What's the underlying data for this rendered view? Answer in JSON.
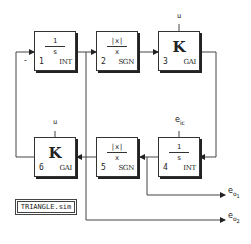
{
  "diagram": {
    "title": "TRIANGLE.sim",
    "line_color": "#333333",
    "blocks": [
      {
        "id": 1,
        "number": "1",
        "type": "INT",
        "numerator": "1",
        "denominator": "s",
        "kind": "fraction"
      },
      {
        "id": 2,
        "number": "2",
        "type": "SGN",
        "numerator": "|x|",
        "denominator": "x",
        "kind": "fraction"
      },
      {
        "id": 3,
        "number": "3",
        "type": "GAI",
        "symbol": "K",
        "kind": "gain",
        "param_label": "u"
      },
      {
        "id": 4,
        "number": "4",
        "type": "INT",
        "numerator": "1",
        "denominator": "s",
        "kind": "fraction",
        "param_label": "e"
      },
      {
        "id": 5,
        "number": "5",
        "type": "SGN",
        "numerator": "|x|",
        "denominator": "x",
        "kind": "fraction"
      },
      {
        "id": 6,
        "number": "6",
        "type": "GAI",
        "symbol": "K",
        "kind": "gain",
        "param_label": "u"
      }
    ],
    "labels": {
      "minus_sign": "-",
      "eic_base": "e",
      "eic_sub": "ic",
      "eo1_base": "e",
      "eo1_sub": "o",
      "eo1_subsub": "1",
      "eo2_base": "e",
      "eo2_sub": "o",
      "eo2_subsub": "2"
    },
    "connections": [
      {
        "from": "1",
        "to": "2"
      },
      {
        "from": "2",
        "to": "3"
      },
      {
        "from": "3",
        "to": "4"
      },
      {
        "from": "4",
        "to": "5"
      },
      {
        "from": "4",
        "to": "e_o1"
      },
      {
        "from": "5",
        "to": "6"
      },
      {
        "from": "6",
        "to": "1",
        "sign": "-"
      },
      {
        "from": "1",
        "to": "e_o2"
      }
    ]
  }
}
